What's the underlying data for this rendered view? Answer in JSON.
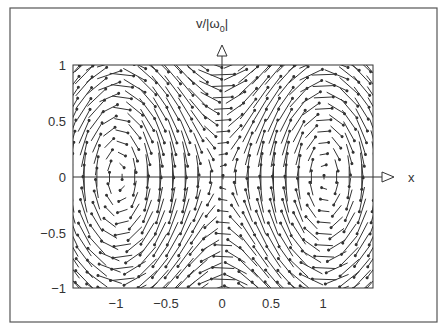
{
  "figure": {
    "y_axis_label": "v/|ω0|",
    "y_axis_label_main": "v/|ω",
    "y_axis_label_sub": "0",
    "y_axis_label_end": "|",
    "x_axis_label": "x"
  },
  "chart_data": {
    "type": "vector_field",
    "title": "",
    "xlabel": "x",
    "ylabel": "v/|ω0|",
    "xlim": [
      -1.45,
      1.47
    ],
    "ylim": [
      -1,
      1
    ],
    "x_ticks": [
      -1,
      -0.5,
      0,
      0.5,
      1
    ],
    "x_tick_labels": [
      "−1",
      "−0.5",
      "0",
      "0.5",
      "1"
    ],
    "y_ticks": [
      1,
      0.5,
      0,
      -0.5,
      -1
    ],
    "y_tick_labels": [
      "1",
      "0.5",
      "0",
      "−0.5",
      "−1"
    ],
    "field": "dx/dt = v, dv/dt = sin(πx) (phase portrait, centers at x=±1, saddle at origin)",
    "centers": [
      [
        -1,
        0
      ],
      [
        1,
        0
      ]
    ],
    "saddles": [
      [
        0,
        0
      ]
    ],
    "circulation": "clockwise",
    "grid": false
  }
}
